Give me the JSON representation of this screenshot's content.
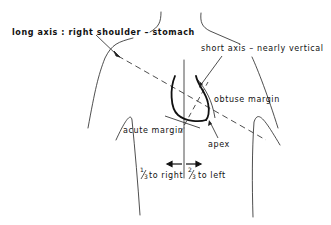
{
  "diagram": {
    "type": "anatomical-line-drawing",
    "colors": {
      "ink": "#111111",
      "background": "#ffffff"
    },
    "labels": {
      "long_axis": "long axis : right shoulder – stomach",
      "short_axis": "short axis – nearly vertical",
      "obtuse_margin": "obtuse margin",
      "acute_margin": "acute margin",
      "apex": "apex",
      "to_right_fraction_num": "1",
      "to_right_fraction_den": "3",
      "to_right_text": "to right",
      "to_left_fraction_num": "2",
      "to_left_fraction_den": "3",
      "to_left_text": "to left"
    }
  }
}
